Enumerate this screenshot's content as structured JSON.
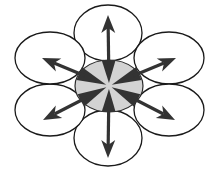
{
  "diagram": {
    "type": "radial-spread",
    "colors": {
      "background": "#ffffff",
      "outline": "#1a1a1a",
      "center_fill": "#d3d3d3",
      "arrow": "#333333"
    },
    "center": {
      "name": "center-node",
      "cx": 109,
      "cy": 86,
      "rx": 34,
      "ry": 26
    },
    "nodes": [
      {
        "name": "top",
        "cx": 108,
        "cy": 33,
        "rx": 34,
        "ry": 28
      },
      {
        "name": "upper-right",
        "cx": 169,
        "cy": 58,
        "rx": 35,
        "ry": 26
      },
      {
        "name": "lower-right",
        "cx": 169,
        "cy": 110,
        "rx": 35,
        "ry": 26
      },
      {
        "name": "bottom",
        "cx": 108,
        "cy": 138,
        "rx": 34,
        "ry": 28
      },
      {
        "name": "lower-left",
        "cx": 50,
        "cy": 110,
        "rx": 35,
        "ry": 26
      },
      {
        "name": "upper-left",
        "cx": 50,
        "cy": 58,
        "rx": 35,
        "ry": 26
      }
    ],
    "arrows": [
      {
        "name": "up",
        "tip": [
          108,
          15
        ],
        "direction": "top"
      },
      {
        "name": "upper-right",
        "tip": [
          176,
          58
        ],
        "direction": "upper-right"
      },
      {
        "name": "lower-right",
        "tip": [
          175,
          120
        ],
        "direction": "lower-right"
      },
      {
        "name": "down",
        "tip": [
          108,
          158
        ],
        "direction": "bottom"
      },
      {
        "name": "lower-left",
        "tip": [
          43,
          120
        ],
        "direction": "lower-left"
      },
      {
        "name": "upper-left",
        "tip": [
          42,
          58
        ],
        "direction": "upper-left"
      }
    ]
  }
}
